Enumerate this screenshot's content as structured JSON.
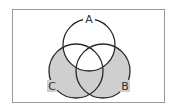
{
  "diagram": {
    "type": "venn",
    "sets": [
      {
        "label": "A",
        "cx": 89,
        "cy": 45,
        "r": 26
      },
      {
        "label": "C",
        "cx": 76,
        "cy": 71,
        "r": 27
      },
      {
        "label": "B",
        "cx": 103,
        "cy": 71,
        "r": 27
      }
    ],
    "shaded_region": "(B ∪ C) − A",
    "shade_color": "#cfcfcf",
    "stroke_color": "#2a2a2a",
    "frame_color": "#9a9a9a"
  },
  "labels": {
    "a": "A",
    "b": "B",
    "c": "C"
  }
}
